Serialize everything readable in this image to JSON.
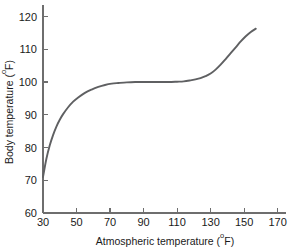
{
  "chart_data": {
    "type": "line",
    "title": "",
    "xlabel": "Atmospheric temperature (°F)",
    "ylabel": "Body temperature (°F)",
    "xlabel_main": "Atmospheric temperature (",
    "xlabel_deg": "o",
    "xlabel_unit": "F)",
    "ylabel_main": "Body temperature (",
    "ylabel_deg": "o",
    "ylabel_unit": "F)",
    "xlim": [
      30,
      175
    ],
    "ylim": [
      60,
      122
    ],
    "xticks": [
      30,
      50,
      70,
      90,
      110,
      130,
      150,
      170
    ],
    "xtick_labels": [
      "30",
      "50",
      "70",
      "90",
      "110",
      "130",
      "150",
      "170"
    ],
    "yticks": [
      60,
      70,
      80,
      90,
      100,
      110,
      120
    ],
    "ytick_labels": [
      "60",
      "70",
      "80",
      "90",
      "100",
      "110",
      "120"
    ],
    "grid": false,
    "legend": false,
    "legend_position": "none",
    "line_color": "#5f6062",
    "axis_color": "#6e6e6e",
    "series": [
      {
        "name": "Body temperature response",
        "x": [
          30,
          32,
          34,
          36,
          38,
          40,
          42,
          45,
          48,
          51,
          55,
          59,
          63,
          67,
          71,
          75,
          80,
          85,
          90,
          95,
          100,
          105,
          110,
          114,
          118,
          121,
          124,
          127,
          130,
          133,
          136,
          139,
          142,
          145,
          148,
          151,
          154,
          157
        ],
        "y": [
          71.0,
          76.5,
          80.6,
          83.8,
          86.4,
          88.5,
          90.2,
          92.3,
          94.0,
          95.3,
          96.7,
          97.7,
          98.5,
          99.1,
          99.5,
          99.7,
          99.9,
          100.0,
          100.0,
          100.0,
          100.0,
          100.0,
          100.1,
          100.2,
          100.5,
          100.8,
          101.2,
          101.8,
          102.6,
          103.8,
          105.3,
          107.0,
          108.8,
          110.6,
          112.4,
          114.0,
          115.3,
          116.3
        ]
      }
    ],
    "annotations": [
      {
        "text": "Plateau near 100°F between about 80°F and 120°F atmospheric temperature"
      }
    ]
  },
  "figure": {
    "background_color": "#ffffff",
    "width": 288,
    "height": 250
  }
}
